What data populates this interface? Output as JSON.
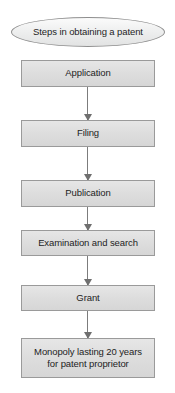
{
  "diagram": {
    "title_node": {
      "label": "Steps in obtaining a patent",
      "shape": "ellipse",
      "fill_color": "#ececec",
      "border_color": "#8e8e8e"
    },
    "nodes": [
      {
        "id": "application",
        "label": "Application",
        "shape": "rectangle",
        "fill_color": "#dedede",
        "border_color": "#9a9a9a"
      },
      {
        "id": "filing",
        "label": "Filing",
        "shape": "rectangle",
        "fill_color": "#dedede",
        "border_color": "#9a9a9a"
      },
      {
        "id": "publication",
        "label": "Publication",
        "shape": "rectangle",
        "fill_color": "#dedede",
        "border_color": "#9a9a9a"
      },
      {
        "id": "examination",
        "label": "Examination and search",
        "shape": "rectangle",
        "fill_color": "#dedede",
        "border_color": "#9a9a9a"
      },
      {
        "id": "grant",
        "label": "Grant",
        "shape": "rectangle",
        "fill_color": "#dedede",
        "border_color": "#9a9a9a"
      },
      {
        "id": "monopoly",
        "label": "Monopoly lasting 20 years for patent proprietor",
        "line_1": "Monopoly lasting 20 years",
        "line_2": "for patent proprietor",
        "shape": "rectangle",
        "fill_color": "#dedede",
        "border_color": "#9a9a9a"
      }
    ],
    "connectors": [
      {
        "from": "application",
        "to": "filing",
        "type": "arrow-down",
        "color": "#7c7c7c"
      },
      {
        "from": "filing",
        "to": "publication",
        "type": "arrow-down",
        "color": "#7c7c7c"
      },
      {
        "from": "publication",
        "to": "examination",
        "type": "arrow-down",
        "color": "#7c7c7c"
      },
      {
        "from": "examination",
        "to": "grant",
        "type": "arrow-down",
        "color": "#7c7c7c"
      },
      {
        "from": "grant",
        "to": "monopoly",
        "type": "arrow-down",
        "color": "#7c7c7c"
      }
    ]
  }
}
